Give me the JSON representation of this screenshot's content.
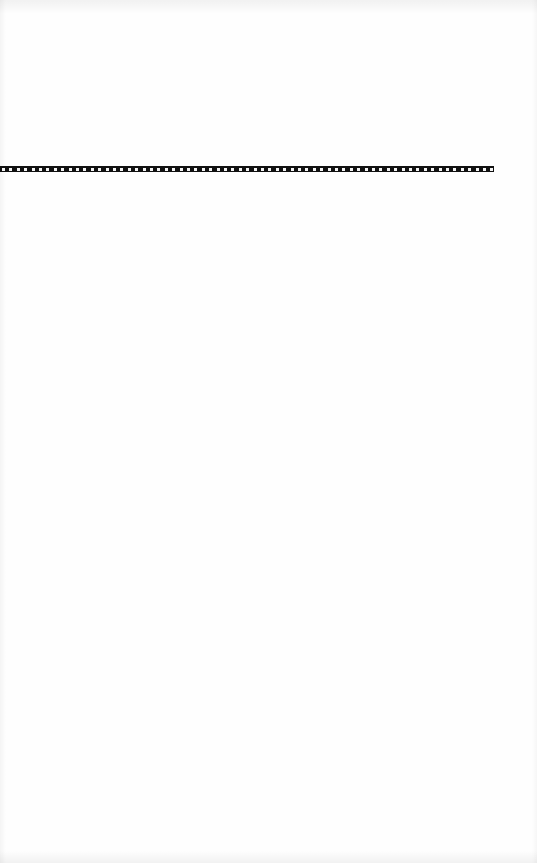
{
  "page": {
    "background": "#fefefe",
    "decorative_rule": {
      "style": "checkered-film-strip",
      "color": "#111111",
      "y": 169,
      "x_start": 0,
      "x_end": 494
    }
  }
}
